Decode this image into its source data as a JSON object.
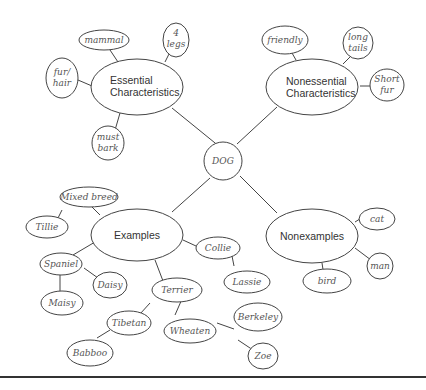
{
  "center": {
    "label": "DOG"
  },
  "categories": {
    "essential": {
      "line1": "Essential",
      "line2": "Characteristics"
    },
    "nonessential": {
      "line1": "Nonessential",
      "line2": "Characteristics"
    },
    "examples": {
      "label": "Examples"
    },
    "nonexamples": {
      "label": "Nonexamples"
    }
  },
  "essential_items": [
    "mammal",
    "4 legs",
    "fur/ hair",
    "must bark"
  ],
  "nonessential_items": [
    "friendly",
    "long tails",
    "Short fur"
  ],
  "examples_items": {
    "mixed_breed": "Mixed breed",
    "tillie": "Tillie",
    "spaniel": "Spaniel",
    "daisy": "Daisy",
    "maisy": "Maisy",
    "terrier": "Terrier",
    "tibetan": "Tibetan",
    "babboo": "Babboo",
    "wheaten": "Wheaten",
    "berkeley": "Berkeley",
    "zoe": "Zoe",
    "collie": "Collie",
    "lassie": "Lassie"
  },
  "nonexamples_items": [
    "cat",
    "man",
    "bird"
  ]
}
